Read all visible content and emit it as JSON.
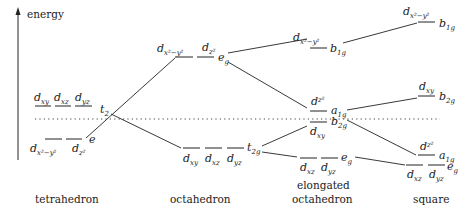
{
  "axis": {
    "label": "energy"
  },
  "captions": {
    "tetrahedron": "tetrahedron",
    "octahedron": "octahedron",
    "elongated_1": "elongated",
    "elongated_2": "octahedron",
    "square": "square"
  },
  "tetrahedron": {
    "upper": {
      "orbitals": [
        "xy",
        "xz",
        "yz"
      ],
      "symmetry": "t",
      "sym_sub": "2"
    },
    "lower": {
      "orbitals": [
        "x²−y²",
        "z²"
      ],
      "symmetry": "e",
      "sym_sub": ""
    }
  },
  "octahedron": {
    "upper": {
      "orbitals": [
        "x²−y²",
        "z²"
      ],
      "symmetry": "e",
      "sym_sub": "g"
    },
    "lower": {
      "orbitals": [
        "xy",
        "xz",
        "yz"
      ],
      "symmetry": "t",
      "sym_sub": "2g"
    }
  },
  "elongated": {
    "b1g": {
      "orbital": "x²−y²",
      "symmetry": "b",
      "sym_sub": "1g"
    },
    "a1g": {
      "orbital": "z²",
      "symmetry": "a",
      "sym_sub": "1g"
    },
    "b2g": {
      "orbital": "xy",
      "symmetry": "b",
      "sym_sub": "2g"
    },
    "eg": {
      "orbitals": [
        "xz",
        "yz"
      ],
      "symmetry": "e",
      "sym_sub": "g"
    }
  },
  "square": {
    "b1g": {
      "orbital": "x²−y²",
      "symmetry": "b",
      "sym_sub": "1g"
    },
    "b2g": {
      "orbital": "xy",
      "symmetry": "b",
      "sym_sub": "2g"
    },
    "a1g": {
      "orbital": "z²",
      "symmetry": "a",
      "sym_sub": "1g"
    },
    "eg": {
      "orbitals": [
        "xz",
        "yz"
      ],
      "symmetry": "e",
      "sym_sub": "g"
    }
  }
}
